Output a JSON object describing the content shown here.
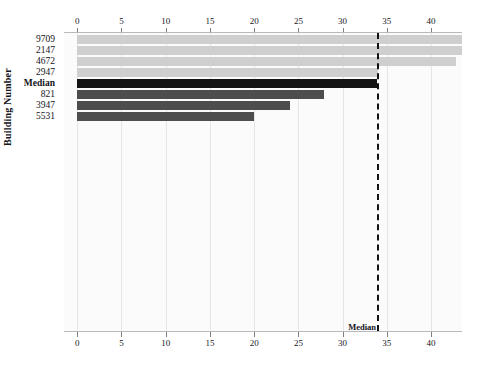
{
  "chart_data": {
    "type": "bar",
    "orientation": "horizontal",
    "title": "",
    "xlabel": "",
    "ylabel": "Building Number",
    "categories": [
      "9709",
      "2147",
      "4672",
      "2947",
      "Median",
      "821",
      "3947",
      "5531"
    ],
    "values": [
      45.0,
      44.2,
      42.8,
      34.0,
      33.9,
      27.9,
      24.0,
      20.0
    ],
    "series": [
      {
        "name": "Building value",
        "values": [
          45.0,
          44.2,
          42.8,
          34.0,
          33.9,
          27.9,
          24.0,
          20.0
        ]
      }
    ],
    "bar_colors": [
      "#cfcfcf",
      "#cfcfcf",
      "#cfcfcf",
      "#cfcfcf",
      "#141414",
      "#4d4d4d",
      "#4d4d4d",
      "#4d4d4d"
    ],
    "xlim": [
      -1.5,
      43.5
    ],
    "xticks": [
      0,
      5,
      10,
      15,
      20,
      25,
      30,
      35,
      40
    ],
    "xticklabels": [
      "0",
      "5",
      "10",
      "15",
      "20",
      "25",
      "30",
      "35",
      "40"
    ],
    "grid": true,
    "grid_axis": "x",
    "legend": "none",
    "annotations": [
      {
        "name": "median-reference-line",
        "label": "Median",
        "value": 33.9,
        "style": "dashed",
        "color": "#111114"
      }
    ],
    "axis_positions": [
      "top",
      "bottom"
    ]
  },
  "axes": {
    "y_axis_title": "Building Number",
    "top_tick_labels": [
      "0",
      "5",
      "10",
      "15",
      "20",
      "25",
      "30",
      "35",
      "40"
    ],
    "bottom_tick_labels": [
      "0",
      "5",
      "10",
      "15",
      "20",
      "25",
      "30",
      "35",
      "40"
    ],
    "category_labels": [
      "9709",
      "2147",
      "4672",
      "2947",
      "Median",
      "821",
      "3947",
      "5531"
    ]
  },
  "annotation": {
    "median_label": "Median"
  },
  "colors": {
    "bar_light": "#cfcfcf",
    "bar_dark": "#4d4d4d",
    "bar_median": "#141414",
    "gridline": "#e6e6e9",
    "median_line": "#111114",
    "plot_background": "#fbfbfb",
    "page_background": "#ffffff",
    "text": "#15151a"
  }
}
